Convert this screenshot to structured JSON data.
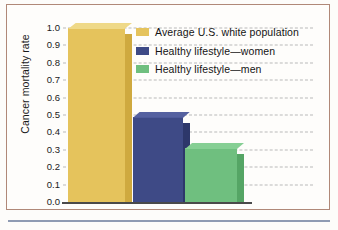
{
  "figure": {
    "background_color": "#fefdfb",
    "frame_color": "#b08878",
    "rule_color": "#8f9bb3"
  },
  "chart_data": {
    "type": "bar",
    "title": "",
    "xlabel": "",
    "ylabel": "Cancer mortality rate",
    "ylim": [
      0.0,
      1.0
    ],
    "ytick_labels": [
      "1.0",
      "0.9",
      "0.8",
      "0.7",
      "0.6",
      "0.5",
      "0.4",
      "0.3",
      "0.2",
      "0.1",
      "0.0"
    ],
    "ytick_values": [
      1.0,
      0.9,
      0.8,
      0.7,
      0.6,
      0.5,
      0.4,
      0.3,
      0.2,
      0.1,
      0.0
    ],
    "grid": true,
    "grid_style": "dashed",
    "legend_position": "upper right",
    "categories": [
      "Average U.S. white population",
      "Healthy lifestyle—women",
      "Healthy lifestyle—men"
    ],
    "values": [
      1.0,
      0.49,
      0.31
    ],
    "colors": [
      "#e5c35c",
      "#3e4a86",
      "#6fbf7f"
    ],
    "side_colors": [
      "#cfa93f",
      "#2d376a",
      "#55a565"
    ],
    "top_colors": [
      "#efd988",
      "#5561a0",
      "#86cf94"
    ]
  },
  "legend": {
    "items": [
      {
        "label": "Average U.S. white population",
        "color": "#e5c35c"
      },
      {
        "label": "Healthy lifestyle—women",
        "color": "#3e4a86"
      },
      {
        "label": "Healthy lifestyle—men",
        "color": "#6fbf7f"
      }
    ]
  }
}
